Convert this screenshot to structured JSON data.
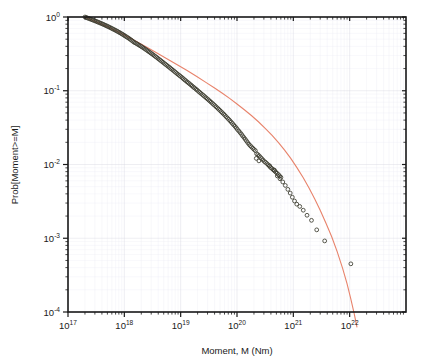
{
  "chart_data": {
    "type": "scatter",
    "title": "",
    "xlabel": "Moment, M (Nm)",
    "ylabel": "Prob[Moment>=M]",
    "xscale": "log",
    "yscale": "log",
    "xlim": [
      1e+17,
      1e+23
    ],
    "ylim": [
      0.0001,
      1
    ],
    "grid": true,
    "legend": null,
    "xtick_labels": [
      "10^17",
      "10^18",
      "10^19",
      "10^20",
      "10^21",
      "10^22"
    ],
    "xtick_bases": [
      "10",
      "10",
      "10",
      "10",
      "10",
      "10"
    ],
    "xtick_exponents": [
      "17",
      "18",
      "19",
      "20",
      "21",
      "22"
    ],
    "xtick_values": [
      1e+17,
      1e+18,
      1e+19,
      1e+20,
      1e+21,
      1e+22
    ],
    "ytick_labels": [
      "10^0",
      "10^-1",
      "10^-2",
      "10^-3",
      "10^-4"
    ],
    "ytick_bases": [
      "10",
      "10",
      "10",
      "10",
      "10"
    ],
    "ytick_exponents": [
      "0",
      "-1",
      "-2",
      "-3",
      "-4"
    ],
    "ytick_values": [
      1,
      0.1,
      0.01,
      0.001,
      0.0001
    ],
    "series": [
      {
        "name": "empirical-cumulative-distribution",
        "type": "scatter",
        "marker": "open-circle",
        "marker_color": "#3b3b2e",
        "points": [
          [
            2e+17,
            1.0
          ],
          [
            2.1e+17,
            0.985
          ],
          [
            2.2e+17,
            0.971
          ],
          [
            2.32e+17,
            0.957
          ],
          [
            2.44e+17,
            0.943
          ],
          [
            2.57e+17,
            0.929
          ],
          [
            2.7e+17,
            0.915
          ],
          [
            2.85e+17,
            0.901
          ],
          [
            3e+17,
            0.887
          ],
          [
            3.16e+17,
            0.873
          ],
          [
            3.33e+17,
            0.859
          ],
          [
            3.5e+17,
            0.845
          ],
          [
            3.69e+17,
            0.831
          ],
          [
            3.88e+17,
            0.818
          ],
          [
            4.09e+17,
            0.804
          ],
          [
            4.3e+17,
            0.79
          ],
          [
            4.53e+17,
            0.776
          ],
          [
            4.77e+17,
            0.762
          ],
          [
            5.02e+17,
            0.748
          ],
          [
            5.29e+17,
            0.734
          ],
          [
            5.57e+17,
            0.72
          ],
          [
            5.86e+17,
            0.706
          ],
          [
            6.17e+17,
            0.692
          ],
          [
            6.5e+17,
            0.678
          ],
          [
            6.84e+17,
            0.665
          ],
          [
            7.21e+17,
            0.651
          ],
          [
            7.59e+17,
            0.637
          ],
          [
            7.99e+17,
            0.623
          ],
          [
            8.41e+17,
            0.609
          ],
          [
            8.86e+17,
            0.595
          ],
          [
            9.33e+17,
            0.581
          ],
          [
            9.82e+17,
            0.567
          ],
          [
            1.03e+18,
            0.553
          ],
          [
            1.09e+18,
            0.539
          ],
          [
            1.15e+18,
            0.525
          ],
          [
            1.21e+18,
            0.512
          ],
          [
            1.27e+18,
            0.498
          ],
          [
            1.34e+18,
            0.484
          ],
          [
            1.41e+18,
            0.47
          ],
          [
            1.48e+18,
            0.456
          ],
          [
            1.56e+18,
            0.446
          ],
          [
            1.65e+18,
            0.436
          ],
          [
            1.73e+18,
            0.426
          ],
          [
            1.82e+18,
            0.416
          ],
          [
            1.92e+18,
            0.406
          ],
          [
            2.02e+18,
            0.396
          ],
          [
            2.13e+18,
            0.386
          ],
          [
            2.24e+18,
            0.376
          ],
          [
            2.36e+18,
            0.366
          ],
          [
            2.49e+18,
            0.356
          ],
          [
            2.62e+18,
            0.346
          ],
          [
            2.76e+18,
            0.337
          ],
          [
            2.9e+18,
            0.327
          ],
          [
            3.06e+18,
            0.318
          ],
          [
            3.22e+18,
            0.309
          ],
          [
            3.39e+18,
            0.3
          ],
          [
            3.57e+18,
            0.291
          ],
          [
            3.76e+18,
            0.283
          ],
          [
            3.96e+18,
            0.274
          ],
          [
            4.17e+18,
            0.266
          ],
          [
            4.39e+18,
            0.258
          ],
          [
            4.62e+18,
            0.25
          ],
          [
            4.86e+18,
            0.243
          ],
          [
            5.12e+18,
            0.235
          ],
          [
            5.39e+18,
            0.228
          ],
          [
            5.68e+18,
            0.221
          ],
          [
            5.98e+18,
            0.214
          ],
          [
            6.3e+18,
            0.208
          ],
          [
            6.63e+18,
            0.201
          ],
          [
            6.98e+18,
            0.195
          ],
          [
            7.35e+18,
            0.189
          ],
          [
            7.74e+18,
            0.183
          ],
          [
            8.15e+18,
            0.177
          ],
          [
            8.59e+18,
            0.171
          ],
          [
            9.04e+18,
            0.166
          ],
          [
            9.52e+18,
            0.161
          ],
          [
            1e+19,
            0.156
          ],
          [
            1.06e+19,
            0.151
          ],
          [
            1.11e+19,
            0.146
          ],
          [
            1.17e+19,
            0.141
          ],
          [
            1.23e+19,
            0.137
          ],
          [
            1.3e+19,
            0.132
          ],
          [
            1.37e+19,
            0.128
          ],
          [
            1.44e+19,
            0.124
          ],
          [
            1.52e+19,
            0.12
          ],
          [
            1.6e+19,
            0.116
          ],
          [
            1.68e+19,
            0.112
          ],
          [
            1.77e+19,
            0.109
          ],
          [
            1.87e+19,
            0.105
          ],
          [
            1.96e+19,
            0.102
          ],
          [
            2.07e+19,
            0.0983
          ],
          [
            2.18e+19,
            0.0951
          ],
          [
            2.29e+19,
            0.092
          ],
          [
            2.42e+19,
            0.089
          ],
          [
            2.54e+19,
            0.0861
          ],
          [
            2.68e+19,
            0.0832
          ],
          [
            2.82e+19,
            0.0804
          ],
          [
            2.97e+19,
            0.0777
          ],
          [
            3.13e+19,
            0.0751
          ],
          [
            3.29e+19,
            0.0725
          ],
          [
            3.47e+19,
            0.07
          ],
          [
            3.65e+19,
            0.0676
          ],
          [
            3.84e+19,
            0.0652
          ],
          [
            4.05e+19,
            0.0629
          ],
          [
            4.26e+19,
            0.0606
          ],
          [
            4.49e+19,
            0.0584
          ],
          [
            4.72e+19,
            0.0563
          ],
          [
            4.97e+19,
            0.0542
          ],
          [
            5.24e+19,
            0.0521
          ],
          [
            5.51e+19,
            0.0501
          ],
          [
            5.81e+19,
            0.0482
          ],
          [
            6.11e+19,
            0.0463
          ],
          [
            6.44e+19,
            0.0444
          ],
          [
            6.78e+19,
            0.0426
          ],
          [
            7.14e+19,
            0.0409
          ],
          [
            7.52e+19,
            0.0392
          ],
          [
            7.91e+19,
            0.0375
          ],
          [
            8.33e+19,
            0.0359
          ],
          [
            8.77e+19,
            0.0343
          ],
          [
            9.24e+19,
            0.0328
          ],
          [
            9.73e+19,
            0.0313
          ],
          [
            1.02e+20,
            0.0298
          ],
          [
            1.08e+20,
            0.0284
          ],
          [
            1.14e+20,
            0.027
          ],
          [
            1.2e+20,
            0.0257
          ],
          [
            1.26e+20,
            0.0244
          ],
          [
            1.33e+20,
            0.0232
          ],
          [
            1.4e+20,
            0.022
          ],
          [
            1.47e+20,
            0.0209
          ],
          [
            1.55e+20,
            0.0198
          ],
          [
            1.63e+20,
            0.0188
          ],
          [
            1.72e+20,
            0.018
          ],
          [
            1.81e+20,
            0.0173
          ],
          [
            1.91e+20,
            0.0166
          ],
          [
            2.01e+20,
            0.016
          ],
          [
            2.12e+20,
            0.0154
          ],
          [
            2.23e+20,
            0.014
          ],
          [
            2.35e+20,
            0.0136
          ],
          [
            2.48e+20,
            0.0131
          ],
          [
            2.61e+20,
            0.0125
          ],
          [
            2.75e+20,
            0.012
          ],
          [
            2.9e+20,
            0.0115
          ],
          [
            3.05e+20,
            0.011
          ],
          [
            3.21e+20,
            0.0107
          ],
          [
            3.39e+20,
            0.0103
          ],
          [
            3.57e+20,
            0.0099
          ],
          [
            3.76e+20,
            0.0095
          ],
          [
            3.96e+20,
            0.0091
          ],
          [
            4.17e+20,
            0.0088
          ],
          [
            4.4e+20,
            0.0085
          ],
          [
            4.63e+20,
            0.0082
          ],
          [
            4.88e+20,
            0.0079
          ],
          [
            5.14e+20,
            0.0076
          ],
          [
            5.42e+20,
            0.0073
          ],
          [
            5.71e+20,
            0.007
          ],
          [
            6.02e+20,
            0.0067
          ],
          [
            2.2e+20,
            0.0121
          ],
          [
            2.45e+20,
            0.0112
          ],
          [
            3.8e+20,
            0.0096
          ],
          [
            4.6e+20,
            0.0084
          ],
          [
            5.2e+20,
            0.007
          ],
          [
            5.8e+20,
            0.0064
          ],
          [
            6.5e+20,
            0.0058
          ],
          [
            7.2e+20,
            0.0052
          ],
          [
            8e+20,
            0.0046
          ],
          [
            8.8e+20,
            0.0041
          ],
          [
            9.6e+20,
            0.0036
          ],
          [
            1.05e+21,
            0.0032
          ],
          [
            1.15e+21,
            0.0029
          ],
          [
            1.3e+21,
            0.0027
          ],
          [
            1.5e+21,
            0.0024
          ],
          [
            1.75e+21,
            0.00205
          ],
          [
            2.1e+21,
            0.00175
          ],
          [
            2.6e+21,
            0.0013
          ],
          [
            3.6e+21,
            0.00092
          ],
          [
            1.05e+22,
            0.00045
          ]
        ]
      },
      {
        "name": "tapered-pareto-model-fit",
        "type": "line",
        "color": "#e8836b",
        "points": [
          [
            2e+17,
            1.0
          ],
          [
            3e+17,
            0.876
          ],
          [
            5e+17,
            0.741
          ],
          [
            8e+17,
            0.622
          ],
          [
            1.2e+18,
            0.53
          ],
          [
            1.8e+18,
            0.448
          ],
          [
            2.7e+18,
            0.377
          ],
          [
            4e+18,
            0.318
          ],
          [
            6e+18,
            0.266
          ],
          [
            9e+18,
            0.222
          ],
          [
            1.3e+19,
            0.188
          ],
          [
            1.9e+19,
            0.157
          ],
          [
            2.8e+19,
            0.13
          ],
          [
            4e+19,
            0.109
          ],
          [
            5.5e+19,
            0.0925
          ],
          [
            7.5e+19,
            0.0781
          ],
          [
            1e+20,
            0.0661
          ],
          [
            1.35e+20,
            0.0553
          ],
          [
            1.8e+20,
            0.0462
          ],
          [
            2.4e+20,
            0.038
          ],
          [
            3.2e+20,
            0.0307
          ],
          [
            4.2e+20,
            0.0248
          ],
          [
            5.5e+20,
            0.0197
          ],
          [
            7e+20,
            0.0157
          ],
          [
            9e+20,
            0.0121
          ],
          [
            1.15e+21,
            0.00915
          ],
          [
            1.5e+21,
            0.0066
          ],
          [
            1.9e+21,
            0.0048
          ],
          [
            2.4e+21,
            0.0034
          ],
          [
            3e+21,
            0.0024
          ],
          [
            3.8e+21,
            0.0016
          ],
          [
            4.8e+21,
            0.00105
          ],
          [
            6e+21,
            0.00066
          ],
          [
            7.5e+21,
            0.00039
          ],
          [
            9e+21,
            0.00024
          ],
          [
            1.05e+22,
            0.00015
          ],
          [
            1.2e+22,
            9.6e-05
          ],
          [
            1.35e+22,
            6.2e-05
          ]
        ]
      }
    ]
  },
  "axes": {
    "background": "#ffffff",
    "frame_color": "#1a1a1a",
    "grid_color": "#d8d8e2"
  }
}
